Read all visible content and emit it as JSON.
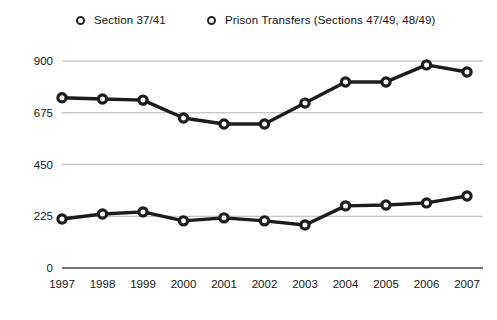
{
  "chart_data": {
    "type": "line",
    "title": "",
    "subtitle": "",
    "xlabel": "",
    "ylabel": "",
    "categories": [
      "1997",
      "1998",
      "1999",
      "2000",
      "2001",
      "2002",
      "2003",
      "2004",
      "2005",
      "2006",
      "2007"
    ],
    "x": [
      1997,
      1998,
      1999,
      2000,
      2001,
      2002,
      2003,
      2004,
      2005,
      2006,
      2007
    ],
    "series": [
      {
        "name": "Section 37/41",
        "values": [
          213,
          235,
          244,
          205,
          218,
          205,
          187,
          270,
          274,
          283,
          313
        ],
        "color": "#1c1c1c",
        "marker": "open-circle"
      },
      {
        "name": "Prison Transfers (Sections 47/49, 48/49)",
        "values": [
          740,
          735,
          730,
          652,
          626,
          626,
          717,
          809,
          809,
          883,
          852
        ],
        "color": "#1c1c1c",
        "marker": "open-circle"
      }
    ],
    "ylim": [
      0,
      900
    ],
    "yticks": [
      0,
      225,
      450,
      675,
      900
    ],
    "ytick_labels": [
      "0",
      "225",
      "450",
      "675",
      "900"
    ],
    "xtick_labels": [
      "1997",
      "1998",
      "1999",
      "2000",
      "2001",
      "2002",
      "2003",
      "2004",
      "2005",
      "2006",
      "2007"
    ],
    "grid": true,
    "grid_axis": "y",
    "grid_color": "#aaaaaa",
    "legend_position": "top",
    "legend": [
      "Section 37/41",
      "Prison Transfers (Sections 47/49, 48/49)"
    ],
    "annotations": [],
    "background_color": "#ffffff"
  },
  "legend": {
    "entries": [
      {
        "label": "Section 37/41"
      },
      {
        "label": "Prison Transfers (Sections 47/49, 48/49)"
      }
    ]
  },
  "axes": {
    "y": {
      "labels": [
        "900",
        "675",
        "450",
        "225",
        "0"
      ]
    },
    "x": {
      "labels": [
        "1997",
        "1998",
        "1999",
        "2000",
        "2001",
        "2002",
        "2003",
        "2004",
        "2005",
        "2006",
        "2007"
      ]
    }
  }
}
